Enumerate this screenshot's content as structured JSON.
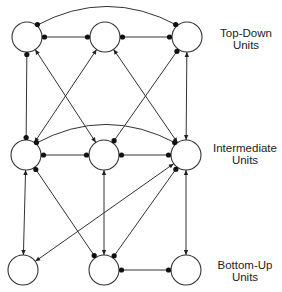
{
  "layers": [
    {
      "id": "top",
      "label_line1": "Top-Down",
      "label_line2": "Units",
      "nodes": [
        "T1",
        "T2",
        "T3"
      ]
    },
    {
      "id": "mid",
      "label_line1": "Intermediate",
      "label_line2": "Units",
      "nodes": [
        "I1",
        "I2",
        "I3"
      ]
    },
    {
      "id": "bot",
      "label_line1": "Bottom-Up",
      "label_line2": "Units",
      "nodes": [
        "B1",
        "B2",
        "B3"
      ]
    }
  ],
  "legend": {
    "dot_end": "inhibitory / lateral connection terminal",
    "arrow_end": "excitatory connection terminal"
  },
  "edges": [
    {
      "from": "T1",
      "to": "T2",
      "start": "dot",
      "end": "dot",
      "shape": "straight"
    },
    {
      "from": "T2",
      "to": "T3",
      "start": "dot",
      "end": "dot",
      "shape": "straight"
    },
    {
      "from": "T1",
      "to": "T3",
      "start": "dot",
      "end": "dot",
      "shape": "arc"
    },
    {
      "from": "T1",
      "to": "I1",
      "start": "dot",
      "end": "dot",
      "shape": "straight"
    },
    {
      "from": "I2",
      "to": "T1",
      "start": "arrow",
      "end": "arrow",
      "shape": "straight"
    },
    {
      "from": "I1",
      "to": "T2",
      "start": "arrow",
      "end": "arrow",
      "shape": "straight"
    },
    {
      "from": "I3",
      "to": "T2",
      "start": "arrow",
      "end": "arrow",
      "shape": "straight"
    },
    {
      "from": "T3",
      "to": "I2",
      "start": "dot",
      "end": "dot",
      "shape": "straight"
    },
    {
      "from": "I3",
      "to": "T3",
      "start": "arrow",
      "end": "arrow",
      "shape": "straight"
    },
    {
      "from": "I1",
      "to": "I2",
      "start": "dot",
      "end": "dot",
      "shape": "straight"
    },
    {
      "from": "I2",
      "to": "I3",
      "start": "dot",
      "end": "dot",
      "shape": "straight"
    },
    {
      "from": "I1",
      "to": "I3",
      "start": "dot",
      "end": "dot",
      "shape": "arc"
    },
    {
      "from": "B1",
      "to": "I1",
      "start": "arrow",
      "end": "arrow",
      "shape": "straight"
    },
    {
      "from": "I1",
      "to": "B2",
      "start": "dot",
      "end": "dot",
      "shape": "straight"
    },
    {
      "from": "B2",
      "to": "I2",
      "start": "arrow",
      "end": "arrow",
      "shape": "straight"
    },
    {
      "from": "I3",
      "to": "B1",
      "start": "arrow",
      "end": "arrow",
      "shape": "straight"
    },
    {
      "from": "I3",
      "to": "B2",
      "start": "dot",
      "end": "dot",
      "shape": "straight"
    },
    {
      "from": "B3",
      "to": "I3",
      "start": "arrow",
      "end": "arrow",
      "shape": "straight"
    },
    {
      "from": "B2",
      "to": "B3",
      "start": "dot",
      "end": "dot",
      "shape": "straight"
    }
  ]
}
